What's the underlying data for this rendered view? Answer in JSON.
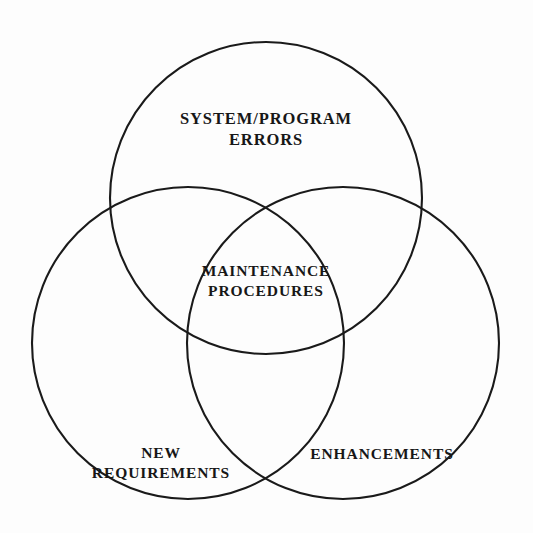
{
  "diagram": {
    "type": "venn",
    "set_count": 3,
    "background_color": "#fdfdfd",
    "stroke_color": "#1a1a1a",
    "text_color": "#171717",
    "circles": [
      {
        "id": "top",
        "cx": 266,
        "cy": 198,
        "r": 156
      },
      {
        "id": "left",
        "cx": 188,
        "cy": 343,
        "r": 156
      },
      {
        "id": "right",
        "cx": 343,
        "cy": 343,
        "r": 156
      }
    ],
    "labels": {
      "top": "SYSTEM/PROGRAM\nERRORS",
      "left": "NEW\nREQUIREMENTS",
      "right": "ENHANCEMENTS",
      "center": "MAINTENANCE\nPROCEDURES"
    }
  }
}
